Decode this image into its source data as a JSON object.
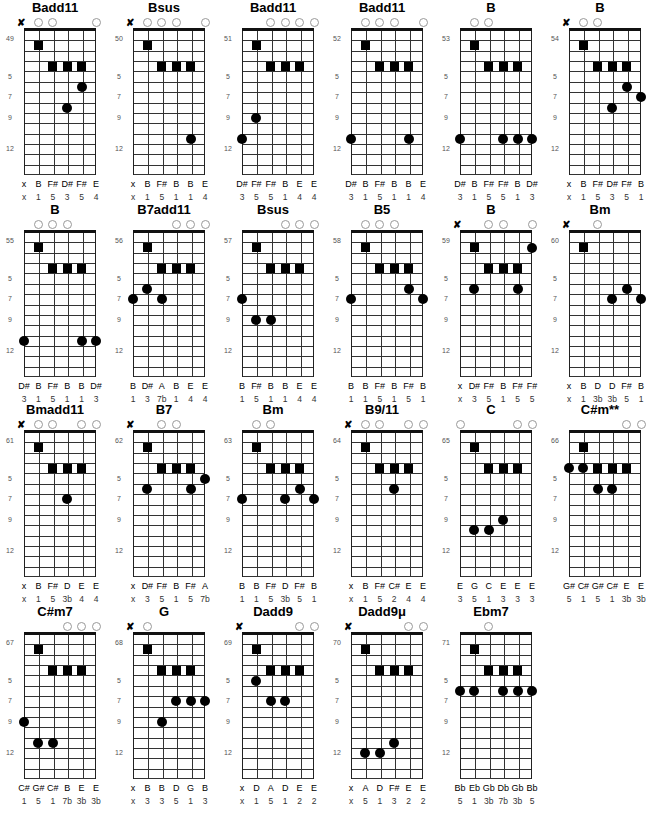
{
  "layout": {
    "col_x": [
      0,
      109,
      218,
      327,
      436,
      545
    ],
    "row_y": [
      0,
      202,
      402,
      604
    ],
    "fret_labels": [
      "5",
      "7",
      "9",
      "12"
    ],
    "fret_label_rows": [
      5,
      7,
      9,
      12
    ]
  },
  "diagrams": [
    {
      "title": "Badd11",
      "number": "49",
      "top": [
        "x",
        "o",
        "o",
        "",
        "",
        "o"
      ],
      "squares": [
        [
          1,
          2
        ],
        [
          2,
          4
        ],
        [
          3,
          4
        ],
        [
          4,
          4
        ]
      ],
      "dots": [
        [
          4,
          6
        ],
        [
          3,
          8
        ]
      ],
      "notes": [
        "x",
        "B",
        "F#",
        "D#",
        "F#",
        "E"
      ],
      "intervals": [
        "x",
        "1",
        "5",
        "3",
        "5",
        "4"
      ]
    },
    {
      "title": "Bsus",
      "number": "50",
      "top": [
        "x",
        "o",
        "o",
        "o",
        "",
        "o"
      ],
      "squares": [
        [
          1,
          2
        ],
        [
          2,
          4
        ],
        [
          3,
          4
        ],
        [
          4,
          4
        ]
      ],
      "dots": [
        [
          4,
          11
        ]
      ],
      "notes": [
        "x",
        "B",
        "F#",
        "B",
        "B",
        "E"
      ],
      "intervals": [
        "x",
        "1",
        "5",
        "1",
        "1",
        "4"
      ]
    },
    {
      "title": "Badd11",
      "number": "51",
      "top": [
        "",
        "",
        "o",
        "o",
        "o",
        "o"
      ],
      "squares": [
        [
          1,
          2
        ],
        [
          2,
          4
        ],
        [
          3,
          4
        ],
        [
          4,
          4
        ]
      ],
      "dots": [
        [
          1,
          9
        ],
        [
          0,
          11
        ]
      ],
      "notes": [
        "D#",
        "F#",
        "F#",
        "B",
        "E",
        "E"
      ],
      "intervals": [
        "3",
        "5",
        "5",
        "1",
        "4",
        "4"
      ]
    },
    {
      "title": "Badd11",
      "number": "52",
      "top": [
        "",
        "o",
        "o",
        "o",
        "",
        "o"
      ],
      "squares": [
        [
          1,
          2
        ],
        [
          2,
          4
        ],
        [
          3,
          4
        ],
        [
          4,
          4
        ]
      ],
      "dots": [
        [
          0,
          11
        ],
        [
          4,
          11
        ]
      ],
      "notes": [
        "D#",
        "B",
        "F#",
        "B",
        "B",
        "E"
      ],
      "intervals": [
        "3",
        "1",
        "5",
        "1",
        "1",
        "4"
      ]
    },
    {
      "title": "B",
      "number": "53",
      "top": [
        "",
        "o",
        "o",
        "",
        "",
        ""
      ],
      "squares": [
        [
          1,
          2
        ],
        [
          2,
          4
        ],
        [
          3,
          4
        ],
        [
          4,
          4
        ]
      ],
      "dots": [
        [
          0,
          11
        ],
        [
          3,
          11
        ],
        [
          4,
          11
        ],
        [
          5,
          11
        ]
      ],
      "notes": [
        "D#",
        "B",
        "F#",
        "F#",
        "B",
        "D#"
      ],
      "intervals": [
        "3",
        "1",
        "5",
        "5",
        "1",
        "3"
      ]
    },
    {
      "title": "B",
      "number": "54",
      "top": [
        "x",
        "o",
        "o",
        "",
        "",
        ""
      ],
      "squares": [
        [
          1,
          2
        ],
        [
          2,
          4
        ],
        [
          3,
          4
        ],
        [
          4,
          4
        ]
      ],
      "dots": [
        [
          4,
          6
        ],
        [
          5,
          7
        ],
        [
          3,
          8
        ]
      ],
      "notes": [
        "x",
        "B",
        "F#",
        "D#",
        "F#",
        "B"
      ],
      "intervals": [
        "x",
        "1",
        "5",
        "3",
        "5",
        "1"
      ]
    },
    {
      "title": "B",
      "number": "55",
      "top": [
        "",
        "o",
        "o",
        "o",
        "",
        ""
      ],
      "squares": [
        [
          1,
          2
        ],
        [
          2,
          4
        ],
        [
          3,
          4
        ],
        [
          4,
          4
        ]
      ],
      "dots": [
        [
          0,
          11
        ],
        [
          4,
          11
        ],
        [
          5,
          11
        ]
      ],
      "notes": [
        "D#",
        "B",
        "F#",
        "B",
        "B",
        "D#"
      ],
      "intervals": [
        "3",
        "1",
        "5",
        "1",
        "1",
        "3"
      ]
    },
    {
      "title": "B7add11",
      "number": "56",
      "top": [
        "",
        "",
        "",
        "o",
        "o",
        "o"
      ],
      "squares": [
        [
          1,
          2
        ],
        [
          2,
          4
        ],
        [
          3,
          4
        ],
        [
          4,
          4
        ]
      ],
      "dots": [
        [
          1,
          6
        ],
        [
          0,
          7
        ],
        [
          2,
          7
        ]
      ],
      "notes": [
        "B",
        "D#",
        "A",
        "B",
        "E",
        "E"
      ],
      "intervals": [
        "1",
        "3",
        "7b",
        "1",
        "4",
        "4"
      ]
    },
    {
      "title": "Bsus",
      "number": "57",
      "top": [
        "",
        "",
        "",
        "o",
        "o",
        "o"
      ],
      "squares": [
        [
          1,
          2
        ],
        [
          2,
          4
        ],
        [
          3,
          4
        ],
        [
          4,
          4
        ]
      ],
      "dots": [
        [
          0,
          7
        ],
        [
          1,
          9
        ],
        [
          2,
          9
        ]
      ],
      "notes": [
        "B",
        "F#",
        "B",
        "B",
        "E",
        "E"
      ],
      "intervals": [
        "1",
        "5",
        "1",
        "1",
        "4",
        "4"
      ]
    },
    {
      "title": "B5",
      "number": "58",
      "top": [
        "",
        "o",
        "o",
        "o",
        "",
        ""
      ],
      "squares": [
        [
          1,
          2
        ],
        [
          2,
          4
        ],
        [
          3,
          4
        ],
        [
          4,
          4
        ]
      ],
      "dots": [
        [
          4,
          6
        ],
        [
          0,
          7
        ],
        [
          5,
          7
        ]
      ],
      "notes": [
        "B",
        "B",
        "F#",
        "B",
        "F#",
        "B"
      ],
      "intervals": [
        "1",
        "1",
        "5",
        "1",
        "5",
        "1"
      ]
    },
    {
      "title": "B",
      "number": "59",
      "top": [
        "x",
        "",
        "o",
        "o",
        "",
        "o"
      ],
      "squares": [
        [
          1,
          2
        ],
        [
          2,
          4
        ],
        [
          3,
          4
        ],
        [
          4,
          4
        ]
      ],
      "dots": [
        [
          5,
          2
        ],
        [
          1,
          6
        ],
        [
          4,
          6
        ]
      ],
      "notes": [
        "x",
        "D#",
        "F#",
        "B",
        "F#",
        "F#"
      ],
      "intervals": [
        "x",
        "3",
        "5",
        "1",
        "5",
        "5"
      ]
    },
    {
      "title": "Bm",
      "number": "60",
      "top": [
        "x",
        "",
        "o",
        "",
        "",
        ""
      ],
      "squares": [
        [
          1,
          2
        ]
      ],
      "dots": [
        [
          4,
          6
        ],
        [
          3,
          7
        ],
        [
          5,
          7
        ]
      ],
      "notes": [
        "x",
        "B",
        "D",
        "D",
        "F#",
        "B"
      ],
      "intervals": [
        "x",
        "1",
        "3b",
        "3b",
        "5",
        "1"
      ]
    },
    {
      "title": "Bmadd11",
      "number": "61",
      "top": [
        "x",
        "o",
        "o",
        "",
        "o",
        "o"
      ],
      "squares": [
        [
          1,
          2
        ],
        [
          2,
          4
        ],
        [
          3,
          4
        ],
        [
          4,
          4
        ]
      ],
      "dots": [
        [
          3,
          7
        ]
      ],
      "notes": [
        "x",
        "B",
        "F#",
        "D",
        "E",
        "E"
      ],
      "intervals": [
        "x",
        "1",
        "5",
        "3b",
        "4",
        "4"
      ]
    },
    {
      "title": "B7",
      "number": "62",
      "top": [
        "x",
        "",
        "o",
        "o",
        "",
        ""
      ],
      "squares": [
        [
          1,
          2
        ],
        [
          2,
          4
        ],
        [
          3,
          4
        ],
        [
          4,
          4
        ]
      ],
      "dots": [
        [
          5,
          5
        ],
        [
          1,
          6
        ],
        [
          4,
          6
        ]
      ],
      "notes": [
        "x",
        "D#",
        "F#",
        "B",
        "F#",
        "A"
      ],
      "intervals": [
        "x",
        "3",
        "5",
        "1",
        "5",
        "7b"
      ]
    },
    {
      "title": "Bm",
      "number": "63",
      "top": [
        "",
        "o",
        "o",
        "",
        "",
        ""
      ],
      "squares": [
        [
          1,
          2
        ],
        [
          2,
          4
        ],
        [
          3,
          4
        ],
        [
          4,
          4
        ]
      ],
      "dots": [
        [
          4,
          6
        ],
        [
          0,
          7
        ],
        [
          3,
          7
        ],
        [
          5,
          7
        ]
      ],
      "notes": [
        "B",
        "B",
        "F#",
        "D",
        "F#",
        "B"
      ],
      "intervals": [
        "1",
        "1",
        "5",
        "3b",
        "5",
        "1"
      ]
    },
    {
      "title": "B9/11",
      "number": "64",
      "top": [
        "x",
        "o",
        "o",
        "",
        "o",
        "o"
      ],
      "squares": [
        [
          1,
          2
        ],
        [
          2,
          4
        ],
        [
          3,
          4
        ],
        [
          4,
          4
        ]
      ],
      "dots": [
        [
          3,
          6
        ]
      ],
      "notes": [
        "x",
        "B",
        "F#",
        "C#",
        "E",
        "E"
      ],
      "intervals": [
        "x",
        "1",
        "5",
        "2",
        "4",
        "4"
      ]
    },
    {
      "title": "C",
      "number": "65",
      "top": [
        "o",
        "",
        "",
        "",
        "o",
        "o"
      ],
      "squares": [
        [
          1,
          2
        ],
        [
          2,
          4
        ],
        [
          3,
          4
        ],
        [
          4,
          4
        ]
      ],
      "dots": [
        [
          3,
          9
        ],
        [
          1,
          10
        ],
        [
          2,
          10
        ]
      ],
      "notes": [
        "E",
        "G",
        "C",
        "E",
        "E",
        "E"
      ],
      "intervals": [
        "3",
        "5",
        "1",
        "3",
        "3",
        "3"
      ]
    },
    {
      "title": "C#m**",
      "number": "66",
      "top": [
        "",
        "",
        "",
        "",
        "o",
        "o"
      ],
      "squares": [
        [
          1,
          2
        ],
        [
          2,
          4
        ],
        [
          3,
          4
        ],
        [
          4,
          4
        ]
      ],
      "dots": [
        [
          0,
          4
        ],
        [
          1,
          4
        ],
        [
          2,
          6
        ],
        [
          3,
          6
        ]
      ],
      "notes": [
        "G#",
        "C#",
        "G#",
        "C#",
        "E",
        "E"
      ],
      "intervals": [
        "5",
        "1",
        "5",
        "1",
        "3b",
        "3b"
      ]
    },
    {
      "title": "C#m7",
      "number": "67",
      "top": [
        "",
        "",
        "",
        "o",
        "o",
        "o"
      ],
      "squares": [
        [
          1,
          2
        ],
        [
          2,
          4
        ],
        [
          3,
          4
        ],
        [
          4,
          4
        ]
      ],
      "dots": [
        [
          0,
          9
        ],
        [
          1,
          11
        ],
        [
          2,
          11
        ]
      ],
      "notes": [
        "C#",
        "G#",
        "C#",
        "B",
        "E",
        "E"
      ],
      "intervals": [
        "1",
        "5",
        "1",
        "7b",
        "3b",
        "3b"
      ]
    },
    {
      "title": "G",
      "number": "68",
      "top": [
        "x",
        "o",
        "",
        "",
        "",
        ""
      ],
      "squares": [
        [
          1,
          2
        ],
        [
          2,
          4
        ],
        [
          3,
          4
        ],
        [
          4,
          4
        ]
      ],
      "dots": [
        [
          3,
          7
        ],
        [
          4,
          7
        ],
        [
          5,
          7
        ],
        [
          2,
          9
        ]
      ],
      "notes": [
        "x",
        "B",
        "B",
        "D",
        "G",
        "B"
      ],
      "intervals": [
        "x",
        "3",
        "3",
        "5",
        "1",
        "3"
      ]
    },
    {
      "title": "Dadd9",
      "number": "69",
      "top": [
        "x",
        "",
        "",
        "",
        "o",
        "o"
      ],
      "squares": [
        [
          1,
          2
        ],
        [
          2,
          4
        ],
        [
          3,
          4
        ],
        [
          4,
          4
        ]
      ],
      "dots": [
        [
          1,
          5
        ],
        [
          2,
          7
        ],
        [
          3,
          7
        ]
      ],
      "notes": [
        "x",
        "D",
        "A",
        "D",
        "E",
        "E"
      ],
      "intervals": [
        "x",
        "1",
        "5",
        "1",
        "2",
        "2"
      ]
    },
    {
      "title": "Dadd9μ",
      "number": "70",
      "top": [
        "x",
        "",
        "",
        "",
        "o",
        "o"
      ],
      "squares": [
        [
          1,
          2
        ],
        [
          2,
          4
        ],
        [
          3,
          4
        ],
        [
          4,
          4
        ]
      ],
      "dots": [
        [
          3,
          11
        ],
        [
          1,
          12
        ],
        [
          2,
          12
        ]
      ],
      "notes": [
        "x",
        "A",
        "D",
        "F#",
        "E",
        "E"
      ],
      "intervals": [
        "x",
        "5",
        "1",
        "3",
        "2",
        "2"
      ]
    },
    {
      "title": "Ebm7",
      "number": "71",
      "top": [
        "",
        "",
        "o",
        "",
        "",
        ""
      ],
      "squares": [
        [
          1,
          2
        ],
        [
          2,
          4
        ],
        [
          3,
          4
        ],
        [
          4,
          4
        ]
      ],
      "dots": [
        [
          0,
          6
        ],
        [
          1,
          6
        ],
        [
          3,
          6
        ],
        [
          4,
          6
        ],
        [
          5,
          6
        ]
      ],
      "notes": [
        "Bb",
        "Eb",
        "Gb",
        "Db",
        "Gb",
        "Bb"
      ],
      "intervals": [
        "5",
        "1",
        "3b",
        "7b",
        "3b",
        "5"
      ]
    }
  ]
}
